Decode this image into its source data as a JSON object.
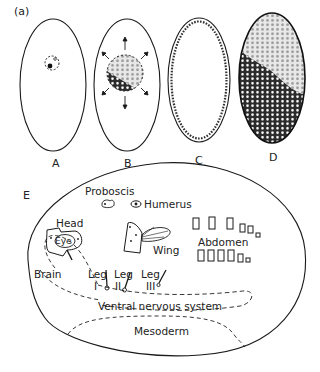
{
  "figure": {
    "label": "(a)",
    "panels": [
      {
        "id": "A",
        "label": "A",
        "description": "Egg with single nucleus near anterior"
      },
      {
        "id": "B",
        "label": "B",
        "description": "Nuclei dividing and migrating outward (arrows)"
      },
      {
        "id": "C",
        "label": "C",
        "description": "Syncytial blastoderm: nuclei at periphery"
      },
      {
        "id": "D",
        "label": "D",
        "description": "Cellular blastoderm"
      },
      {
        "id": "E",
        "label": "E",
        "description": "Fate map of blastoderm"
      }
    ],
    "fate_map": {
      "letter": "E",
      "regions": {
        "proboscis": "Proboscis",
        "humerus": "Humerus",
        "head": "Head",
        "eye": "Eye",
        "wing": "Wing",
        "abdomen": "Abdomen",
        "brain": "Brain",
        "leg1": {
          "word": "Leg",
          "numeral": "I"
        },
        "leg2": {
          "word": "Leg",
          "numeral": "II"
        },
        "leg3": {
          "word": "Leg",
          "numeral": "III"
        },
        "ventral_nervous_system": "Ventral nervous system",
        "mesoderm": "Mesoderm"
      }
    }
  },
  "colors": {
    "line": "#1a1a1a",
    "background": "#ffffff",
    "shade_dark": "#333333",
    "shade_light": "#bfbfbf"
  }
}
